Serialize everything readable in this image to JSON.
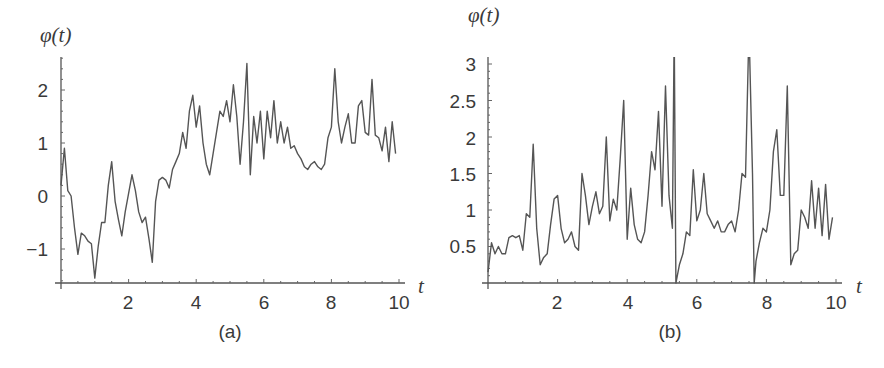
{
  "chart_data": [
    {
      "id": "a",
      "type": "line",
      "caption": "(a)",
      "title": "",
      "xlabel": "t",
      "ylabel": "φ(t)",
      "xlim": [
        0,
        10
      ],
      "ylim": [
        -1.65,
        2.6
      ],
      "xticks": [
        2,
        4,
        6,
        8,
        10
      ],
      "yticks": [
        -1,
        0,
        1,
        2
      ],
      "ytick_labels": [
        "−1",
        "0",
        "1",
        "2"
      ],
      "grid": false,
      "legend": null,
      "frame": {
        "x0": 61,
        "x1": 405,
        "xscale": 33.8,
        "y_zero_px": 196,
        "yscale": 53,
        "axis_y_px": 283,
        "top_px": 57
      },
      "x": [
        0.0,
        0.1,
        0.2,
        0.3,
        0.4,
        0.5,
        0.6,
        0.7,
        0.8,
        0.9,
        1.0,
        1.1,
        1.2,
        1.3,
        1.4,
        1.5,
        1.6,
        1.7,
        1.8,
        1.9,
        2.0,
        2.1,
        2.2,
        2.3,
        2.4,
        2.5,
        2.6,
        2.7,
        2.8,
        2.9,
        3.0,
        3.1,
        3.2,
        3.3,
        3.4,
        3.5,
        3.6,
        3.7,
        3.8,
        3.9,
        4.0,
        4.1,
        4.2,
        4.3,
        4.4,
        4.5,
        4.6,
        4.7,
        4.8,
        4.9,
        5.0,
        5.1,
        5.2,
        5.3,
        5.4,
        5.5,
        5.6,
        5.7,
        5.8,
        5.9,
        6.0,
        6.1,
        6.2,
        6.3,
        6.4,
        6.5,
        6.6,
        6.7,
        6.8,
        6.9,
        7.0,
        7.1,
        7.2,
        7.3,
        7.4,
        7.5,
        7.6,
        7.7,
        7.8,
        7.9,
        8.0,
        8.1,
        8.2,
        8.3,
        8.4,
        8.5,
        8.6,
        8.7,
        8.8,
        8.9,
        9.0,
        9.1,
        9.2,
        9.3,
        9.4,
        9.5,
        9.6,
        9.7,
        9.8,
        9.9
      ],
      "values": [
        0.2,
        0.9,
        0.1,
        0.0,
        -0.6,
        -1.1,
        -0.7,
        -0.75,
        -0.85,
        -0.9,
        -1.55,
        -0.95,
        -0.5,
        -0.5,
        0.2,
        0.65,
        -0.1,
        -0.45,
        -0.75,
        -0.3,
        0.05,
        0.4,
        0.1,
        -0.3,
        -0.5,
        -0.4,
        -0.8,
        -1.25,
        -0.1,
        0.3,
        0.35,
        0.3,
        0.15,
        0.5,
        0.65,
        0.8,
        1.2,
        0.9,
        1.6,
        1.9,
        1.3,
        1.7,
        1.0,
        0.6,
        0.4,
        0.8,
        1.2,
        1.6,
        1.5,
        1.8,
        1.4,
        2.1,
        1.5,
        0.6,
        1.4,
        2.5,
        0.4,
        1.5,
        1.0,
        1.6,
        0.7,
        1.6,
        1.1,
        1.8,
        1.0,
        1.4,
        1.0,
        1.3,
        0.9,
        0.95,
        0.8,
        0.7,
        0.55,
        0.5,
        0.6,
        0.65,
        0.55,
        0.5,
        0.6,
        1.1,
        1.3,
        2.4,
        1.4,
        1.0,
        1.3,
        1.55,
        1.0,
        1.0,
        1.7,
        1.8,
        1.2,
        1.15,
        2.2,
        1.15,
        1.1,
        0.85,
        1.3,
        0.65,
        1.4,
        0.8,
        1.5,
        0.6,
        1.2,
        1.4,
        0.55,
        0.95
      ]
    },
    {
      "id": "b",
      "type": "line",
      "caption": "(b)",
      "title": "",
      "xlabel": "t",
      "ylabel": "φ(t)",
      "xlim": [
        0,
        10
      ],
      "ylim": [
        0,
        3.0
      ],
      "xticks": [
        2,
        4,
        6,
        8,
        10
      ],
      "yticks": [
        0.5,
        1,
        1.5,
        2,
        2.5,
        3
      ],
      "ytick_labels": [
        "0.5",
        "1",
        "1.5",
        "2",
        "2.5",
        "3"
      ],
      "grid": false,
      "legend": null,
      "annotations": [
        "spikes at t≈5.35 and t≈7.65 exceed the plotted range (clipped at top)"
      ],
      "frame": {
        "x0": 488,
        "x1": 842,
        "xscale": 34.8,
        "y_zero_px": 283,
        "yscale": 73,
        "axis_y_px": 283,
        "top_px": 57
      },
      "x": [
        0.0,
        0.1,
        0.2,
        0.3,
        0.4,
        0.5,
        0.6,
        0.7,
        0.8,
        0.9,
        1.0,
        1.1,
        1.2,
        1.3,
        1.4,
        1.5,
        1.6,
        1.7,
        1.8,
        1.9,
        2.0,
        2.1,
        2.2,
        2.3,
        2.4,
        2.5,
        2.6,
        2.7,
        2.8,
        2.9,
        3.0,
        3.1,
        3.2,
        3.3,
        3.4,
        3.5,
        3.6,
        3.7,
        3.8,
        3.9,
        4.0,
        4.1,
        4.2,
        4.3,
        4.4,
        4.5,
        4.6,
        4.7,
        4.8,
        4.9,
        5.0,
        5.1,
        5.2,
        5.3,
        5.35,
        5.4,
        5.5,
        5.6,
        5.7,
        5.8,
        5.9,
        6.0,
        6.1,
        6.2,
        6.3,
        6.4,
        6.5,
        6.6,
        6.7,
        6.8,
        6.9,
        7.0,
        7.1,
        7.2,
        7.3,
        7.4,
        7.5,
        7.6,
        7.65,
        7.7,
        7.8,
        7.9,
        8.0,
        8.1,
        8.2,
        8.3,
        8.4,
        8.5,
        8.6,
        8.7,
        8.8,
        8.9,
        9.0,
        9.1,
        9.2,
        9.3,
        9.4,
        9.5,
        9.6,
        9.7,
        9.8,
        9.9
      ],
      "values": [
        0.15,
        0.55,
        0.4,
        0.5,
        0.4,
        0.4,
        0.62,
        0.65,
        0.62,
        0.65,
        0.45,
        0.95,
        0.9,
        1.9,
        0.75,
        0.25,
        0.35,
        0.4,
        0.8,
        1.15,
        1.2,
        0.75,
        0.55,
        0.6,
        0.7,
        0.5,
        0.45,
        1.5,
        1.2,
        0.8,
        1.05,
        1.25,
        0.95,
        1.05,
        2.0,
        0.85,
        1.15,
        1.0,
        1.7,
        2.5,
        0.6,
        1.3,
        0.8,
        0.6,
        0.55,
        0.7,
        1.2,
        1.8,
        1.55,
        2.35,
        1.05,
        2.7,
        1.2,
        0.75,
        3.5,
        0.0,
        0.25,
        0.4,
        0.7,
        0.65,
        1.55,
        0.85,
        1.0,
        1.5,
        0.95,
        0.85,
        0.75,
        0.85,
        0.7,
        0.7,
        0.8,
        0.85,
        0.7,
        1.0,
        1.5,
        1.45,
        3.5,
        1.5,
        0.0,
        0.3,
        0.55,
        0.75,
        0.7,
        1.0,
        1.8,
        2.1,
        1.2,
        1.2,
        2.7,
        0.25,
        0.4,
        0.45,
        1.0,
        0.9,
        0.75,
        1.4,
        0.75,
        1.3,
        0.65,
        1.35,
        0.6,
        0.9
      ]
    }
  ],
  "panels": {
    "a": {
      "ylabel": "φ(t)",
      "xlabel": "t",
      "caption": "(a)",
      "xtick_labels": [
        "2",
        "4",
        "6",
        "8",
        "10"
      ],
      "ytick_labels": [
        "2",
        "1",
        "0",
        "−1"
      ]
    },
    "b": {
      "ylabel": "φ(t)",
      "xlabel": "t",
      "caption": "(b)",
      "xtick_labels": [
        "2",
        "4",
        "6",
        "8",
        "10"
      ],
      "ytick_labels": [
        "3",
        "2.5",
        "2",
        "1.5",
        "1",
        "0.5"
      ]
    }
  }
}
